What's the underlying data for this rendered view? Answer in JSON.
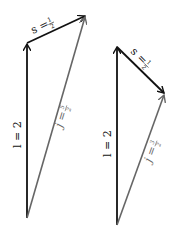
{
  "figures": [
    {
      "id": "left",
      "vectors": {
        "l": {
          "label": "l = 2",
          "color": "#111111"
        },
        "s": {
          "label": "s = ",
          "frac_num": "1",
          "frac_den": "2",
          "color": "#111111"
        },
        "j": {
          "label": "j = ",
          "frac_num": "5",
          "frac_den": "2",
          "color": "#666666"
        }
      }
    },
    {
      "id": "right",
      "vectors": {
        "l": {
          "label": "l = 2",
          "color": "#111111"
        },
        "s": {
          "label": "s = ",
          "frac_num": "1",
          "frac_den": "2",
          "color": "#111111"
        },
        "j": {
          "label": "j = ",
          "frac_num": "3",
          "frac_den": "2",
          "color": "#666666"
        }
      }
    }
  ],
  "colors": {
    "dark": "#111111",
    "gray": "#666666",
    "background": "#ffffff"
  }
}
